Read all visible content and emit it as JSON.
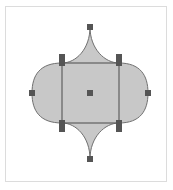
{
  "canvas": {
    "width": 173,
    "height": 190
  },
  "frame": {
    "border_color": "#dcdcdc",
    "background": "#ffffff"
  },
  "shape": {
    "name": "arabesque-tile",
    "fill": "#c8c8c8",
    "stroke": "#707070",
    "top_point": [
      90,
      27
    ],
    "bottom_point": [
      90,
      159
    ],
    "left_extreme": [
      32,
      93
    ],
    "right_extreme": [
      148,
      93
    ],
    "inner_square": {
      "x1": 62,
      "y1": 63,
      "x2": 119,
      "y2": 123
    }
  },
  "handles": {
    "color": "#555555",
    "size": 6,
    "points": [
      {
        "name": "top",
        "x": 90,
        "y": 27
      },
      {
        "name": "top-left-upper",
        "x": 62,
        "y": 57
      },
      {
        "name": "top-left",
        "x": 62,
        "y": 63
      },
      {
        "name": "top-right-upper",
        "x": 119,
        "y": 57
      },
      {
        "name": "top-right",
        "x": 119,
        "y": 63
      },
      {
        "name": "left",
        "x": 32,
        "y": 93
      },
      {
        "name": "center",
        "x": 90,
        "y": 93
      },
      {
        "name": "right",
        "x": 148,
        "y": 93
      },
      {
        "name": "bottom-left",
        "x": 62,
        "y": 123
      },
      {
        "name": "bottom-left-lower",
        "x": 62,
        "y": 129
      },
      {
        "name": "bottom-right",
        "x": 119,
        "y": 123
      },
      {
        "name": "bottom-right-lower",
        "x": 119,
        "y": 129
      },
      {
        "name": "bottom",
        "x": 90,
        "y": 159
      }
    ]
  }
}
